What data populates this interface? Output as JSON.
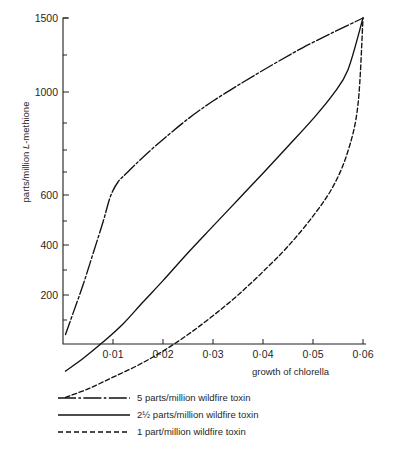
{
  "chart_data": {
    "type": "line",
    "title": "",
    "xlabel": "growth of chlorella",
    "ylabel": "parts/million L·methione",
    "ylabel_prefix": "parts/million ",
    "ylabel_italic": "L",
    "ylabel_suffix": "-methione",
    "xlim": [
      0,
      0.062
    ],
    "ylim": [
      80,
      1500
    ],
    "yscale": "log",
    "grid": false,
    "legend_position": "below-plot",
    "x_ticks": [
      0.01,
      0.02,
      0.03,
      0.04,
      0.05,
      0.06
    ],
    "x_tick_labels": [
      "0·01",
      "0·02",
      "0·03",
      "0·04",
      "0·05",
      "0·06"
    ],
    "y_ticks": [
      200,
      400,
      600,
      1000,
      1500
    ],
    "y_tick_labels": [
      "200",
      "400",
      "600",
      "1000",
      "1500"
    ],
    "y_minor_ticks": [
      100,
      150,
      300,
      500,
      700,
      800,
      900,
      1200
    ],
    "series": [
      {
        "name": "5 parts/million wildfire toxin",
        "legend_label": "5 parts/million wildfire toxin",
        "style": "dash-dot",
        "x": [
          0.0005,
          0.002,
          0.004,
          0.006,
          0.008,
          0.0095,
          0.011,
          0.013,
          0.016,
          0.02,
          0.025,
          0.03,
          0.036,
          0.042,
          0.048,
          0.054,
          0.06
        ],
        "y": [
          150,
          175,
          215,
          270,
          340,
          410,
          455,
          490,
          545,
          620,
          720,
          820,
          940,
          1070,
          1210,
          1350,
          1500
        ]
      },
      {
        "name": "2½ parts/million wildfire toxin",
        "legend_label": "2½ parts/million wildfire toxin",
        "style": "solid",
        "x": [
          0.0005,
          0.004,
          0.008,
          0.012,
          0.016,
          0.02,
          0.025,
          0.03,
          0.035,
          0.04,
          0.045,
          0.05,
          0.054,
          0.057,
          0.06
        ],
        "y": [
          115,
          126,
          142,
          162,
          190,
          222,
          272,
          330,
          400,
          485,
          590,
          720,
          860,
          1030,
          1500
        ]
      },
      {
        "name": "1 part/million wildfire toxin",
        "legend_label": "1 part/million wildfire toxin",
        "style": "dashed",
        "x": [
          0.0005,
          0.005,
          0.01,
          0.015,
          0.02,
          0.025,
          0.03,
          0.035,
          0.04,
          0.045,
          0.05,
          0.054,
          0.057,
          0.059,
          0.06
        ],
        "y": [
          95,
          101,
          110,
          120,
          133,
          150,
          172,
          200,
          237,
          285,
          355,
          440,
          570,
          800,
          1500
        ]
      }
    ]
  },
  "legend": {
    "items": [
      {
        "label": "5 parts/million wildfire toxin",
        "style": "dash-dot"
      },
      {
        "label": "2½ parts/million wildfire toxin",
        "style": "solid"
      },
      {
        "label": "1 part/million wildfire toxin",
        "style": "dashed"
      }
    ]
  },
  "colors": {
    "ink": "#111111",
    "axis": "#202020",
    "background": "#ffffff"
  }
}
